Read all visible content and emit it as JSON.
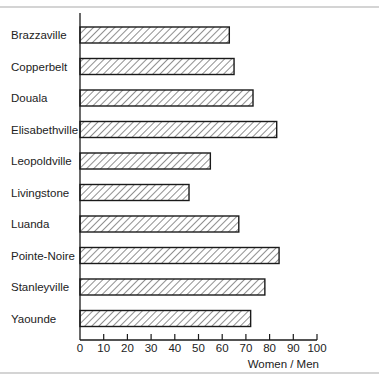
{
  "chart_data": {
    "type": "bar",
    "orientation": "horizontal",
    "title": "",
    "xlabel": "Women / Men",
    "ylabel": "",
    "xlim": [
      0,
      100
    ],
    "xticks": [
      0,
      10,
      20,
      30,
      40,
      50,
      60,
      70,
      80,
      90,
      100
    ],
    "grid": false,
    "legend": null,
    "fill_pattern": "diagonal-hatch",
    "categories": [
      "Brazzaville",
      "Copperbelt",
      "Douala",
      "Elisabethville",
      "Leopoldville",
      "Livingstone",
      "Luanda",
      "Pointe-Noire",
      "Stanleyville",
      "Yaounde"
    ],
    "values": [
      63,
      65,
      73,
      83,
      55,
      46,
      67,
      84,
      78,
      72
    ]
  },
  "colors": {
    "bar_stroke": "#1a1a1a",
    "hatch": "#333333",
    "frame": "#d4d4d4"
  }
}
